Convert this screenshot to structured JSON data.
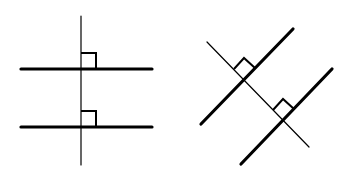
{
  "figure": {
    "colors": {
      "line": "#000000",
      "background": "#ffffff"
    },
    "left_diagram": {
      "orientation": "axis-aligned",
      "transversal": {
        "x1": 81,
        "y1": 16,
        "x2": 81,
        "y2": 165
      },
      "parallel_lines": [
        {
          "x1": 21,
          "y1": 69,
          "x2": 152,
          "y2": 69
        },
        {
          "x1": 21,
          "y1": 127,
          "x2": 152,
          "y2": 127
        }
      ],
      "right_angle_marks": [
        {
          "points": "81,53 96,53 96,69"
        },
        {
          "points": "81,111 96,111 96,127"
        }
      ]
    },
    "right_diagram": {
      "orientation": "rotated-45",
      "transversal": {
        "x1": 207,
        "y1": 42,
        "x2": 309,
        "y2": 147
      },
      "parallel_lines": [
        {
          "x1": 201,
          "y1": 124,
          "x2": 293,
          "y2": 29
        },
        {
          "x1": 241,
          "y1": 164,
          "x2": 332,
          "y2": 69
        }
      ],
      "right_angle_marks": [
        {
          "points": "234,69 244,58 255,68"
        },
        {
          "points": "273,110 283,99 294,109"
        }
      ]
    }
  }
}
